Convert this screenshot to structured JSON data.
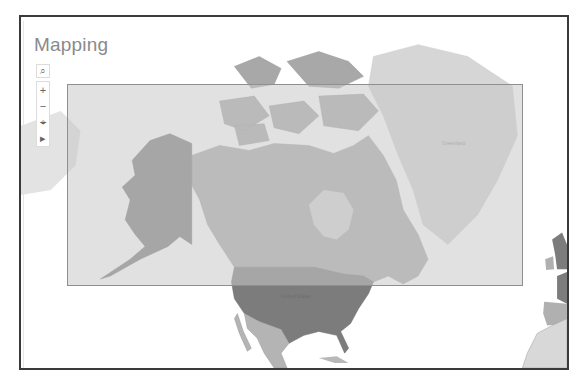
{
  "panel": {
    "title": "Mapping"
  },
  "map_controls": {
    "search": {
      "icon": "search-icon",
      "glyph": "⌕"
    },
    "zoom_in": {
      "icon": "plus-icon",
      "glyph": "+"
    },
    "zoom_out": {
      "icon": "minus-icon",
      "glyph": "−"
    },
    "clear_selection": {
      "icon": "clear-selection-icon",
      "glyph": "⌖"
    },
    "play": {
      "icon": "play-icon",
      "glyph": "▸"
    }
  },
  "map": {
    "labels": {
      "greenland": "Greenland",
      "united_states": "United States"
    },
    "colors": {
      "water": "#ffffff",
      "selection_fill": "#c8c8c8",
      "selection_border": "#8f8f8f",
      "usa_alaska": "#7c7c7c",
      "canada": "#acacac",
      "mexico": "#b4b4b4",
      "greenland": "#d6d6d6",
      "europe_dark": "#8a8a8a",
      "europe_mid": "#b0b0b0",
      "africa": "#d8d8d8",
      "frame_border": "#3a3a3a"
    }
  }
}
